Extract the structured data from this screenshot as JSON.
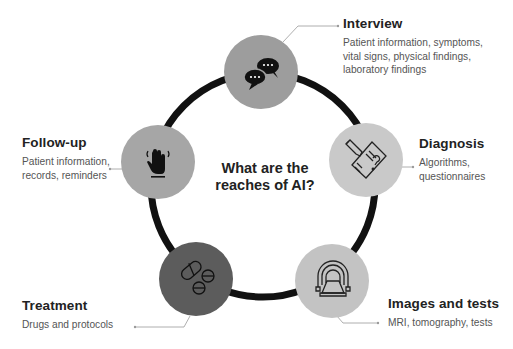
{
  "center": {
    "title_line1": "What are the",
    "title_line2": "reaches of AI?"
  },
  "colors": {
    "ring": "#111111",
    "connector": "#9a9a9a",
    "interview_circle": "#9d9d9d",
    "diagnosis_circle": "#c9c9c9",
    "images_circle": "#c3c3c3",
    "treatment_circle": "#5c5c5c",
    "followup_circle": "#a6a6a6"
  },
  "stages": [
    {
      "id": "interview",
      "title": "Interview",
      "desc_lines": [
        "Patient information, symptoms,",
        "vital signs, physical findings,",
        "laboratory findings"
      ],
      "icon": "chat-bubbles-icon"
    },
    {
      "id": "diagnosis",
      "title": "Diagnosis",
      "desc_lines": [
        "Algorithms,",
        "questionnaires"
      ],
      "icon": "document-question-icon"
    },
    {
      "id": "images",
      "title": "Images and tests",
      "desc_lines": [
        "MRI, tomography, tests"
      ],
      "icon": "mri-scanner-icon"
    },
    {
      "id": "treatment",
      "title": "Treatment",
      "desc_lines": [
        "Drugs and protocols"
      ],
      "icon": "pills-icon"
    },
    {
      "id": "followup",
      "title": "Follow-up",
      "desc_lines": [
        "Patient information,",
        "records, reminders"
      ],
      "icon": "waving-hand-icon"
    }
  ]
}
